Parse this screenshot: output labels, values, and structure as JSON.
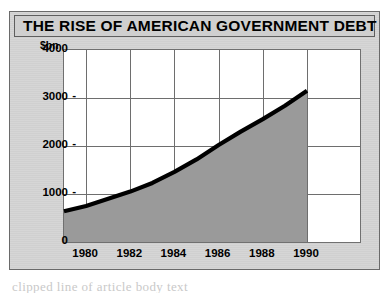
{
  "figure": {
    "title": "THE RISE OF AMERICAN GOVERNMENT DEBT",
    "unit_label": "$bn",
    "frame_color": "#6a6a6a",
    "panel_color": "#d2d2d2",
    "title_bar_color": "#cfcfcf"
  },
  "chart_data": {
    "type": "area",
    "title": "THE RISE OF AMERICAN GOVERNMENT DEBT",
    "subtitle": "",
    "xlabel": "",
    "ylabel": "$bn",
    "x": [
      1979,
      1980,
      1981,
      1982,
      1983,
      1984,
      1985,
      1986,
      1987,
      1988,
      1989,
      1990
    ],
    "values": [
      640,
      750,
      900,
      1050,
      1230,
      1460,
      1720,
      2020,
      2300,
      2560,
      2840,
      3150
    ],
    "xlim": [
      1979,
      1992.4
    ],
    "ylim": [
      0,
      4000
    ],
    "xticks": [
      1980,
      1982,
      1984,
      1986,
      1988,
      1990
    ],
    "xtick_labels": [
      "1980",
      "1982",
      "1984",
      "1986",
      "1988",
      "1990"
    ],
    "yticks": [
      0,
      1000,
      2000,
      3000,
      4000
    ],
    "ytick_labels": [
      "0",
      "1000",
      "2000",
      "3000",
      "4000"
    ],
    "grid": true,
    "legend": false,
    "legend_position": "none",
    "series": [
      {
        "name": "US federal government debt",
        "line_color": "#000000",
        "fill_color": "#9a9a9a",
        "values": [
          640,
          750,
          900,
          1050,
          1230,
          1460,
          1720,
          2020,
          2300,
          2560,
          2840,
          3150
        ]
      }
    ],
    "annotations": []
  },
  "body_copy": {
    "text": "clipped line of article body text"
  }
}
